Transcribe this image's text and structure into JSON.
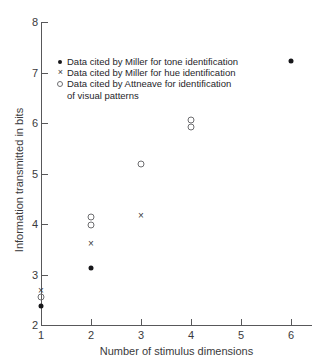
{
  "chart_data": {
    "type": "scatter",
    "title": "",
    "xlabel": "Number of stimulus dimensions",
    "ylabel": "Information transmitted in bits",
    "xlim": [
      1,
      6
    ],
    "ylim": [
      2,
      8
    ],
    "xticks": [
      1,
      2,
      3,
      4,
      5,
      6
    ],
    "yticks": [
      2,
      3,
      4,
      5,
      6,
      7,
      8
    ],
    "xticklabels": [
      "1",
      "2",
      "3",
      "4",
      "5",
      "6"
    ],
    "yticklabels": [
      "2",
      "3",
      "4",
      "5",
      "6",
      "7",
      "8"
    ],
    "grid": false,
    "legend_position": "upper-left-inside",
    "series": [
      {
        "name": "Data cited by Miller for tone identification",
        "marker": "filled-circle",
        "color": "#17171a",
        "points": [
          {
            "x": 1,
            "y": 2.38
          },
          {
            "x": 2,
            "y": 3.12
          },
          {
            "x": 6,
            "y": 7.22
          }
        ]
      },
      {
        "name": "Data cited by Miller for hue identification",
        "marker": "cross",
        "color": "#3a3a3c",
        "points": [
          {
            "x": 1,
            "y": 2.7
          },
          {
            "x": 2,
            "y": 3.62
          },
          {
            "x": 3,
            "y": 4.17
          }
        ]
      },
      {
        "name": "Data cited by Attneave for identification of visual patterns",
        "marker": "open-circle",
        "color": "#6d6d70",
        "points": [
          {
            "x": 1,
            "y": 2.55
          },
          {
            "x": 2,
            "y": 4.13
          },
          {
            "x": 2,
            "y": 3.98
          },
          {
            "x": 3,
            "y": 5.18
          },
          {
            "x": 4,
            "y": 6.05
          },
          {
            "x": 4,
            "y": 5.93
          }
        ]
      }
    ]
  },
  "legend": {
    "entries": [
      {
        "marker": "filled-circle",
        "label": "Data cited by Miller for tone identification",
        "continuation": ""
      },
      {
        "marker": "cross",
        "label": "Data cited by Miller for hue identification",
        "continuation": ""
      },
      {
        "marker": "open-circle",
        "label": "Data cited by Attneave for identification",
        "continuation": "of visual patterns"
      }
    ]
  },
  "colors": {
    "axis": "#58585a",
    "text": "#3a3a3c",
    "filled_marker": "#17171a",
    "open_marker": "#6d6d70",
    "background": "#ffffff"
  }
}
